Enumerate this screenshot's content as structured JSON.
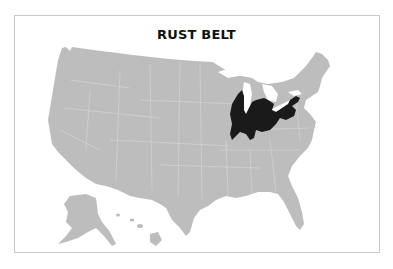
{
  "map": {
    "title": "RUST BELT",
    "region_label": "Rust Belt",
    "highlighted_region_states": [
      "Illinois",
      "Indiana",
      "Michigan",
      "Ohio",
      "Pennsylvania",
      "New York",
      "Wisconsin"
    ],
    "colors": {
      "base_fill": "#bdbdbd",
      "state_border": "#d6d6d6",
      "highlight_fill": "#1a1a1a",
      "water": "#ffffff",
      "frame_border": "#c9c9c9",
      "title_color": "#111111"
    },
    "insets": [
      "Alaska",
      "Hawaii"
    ]
  }
}
